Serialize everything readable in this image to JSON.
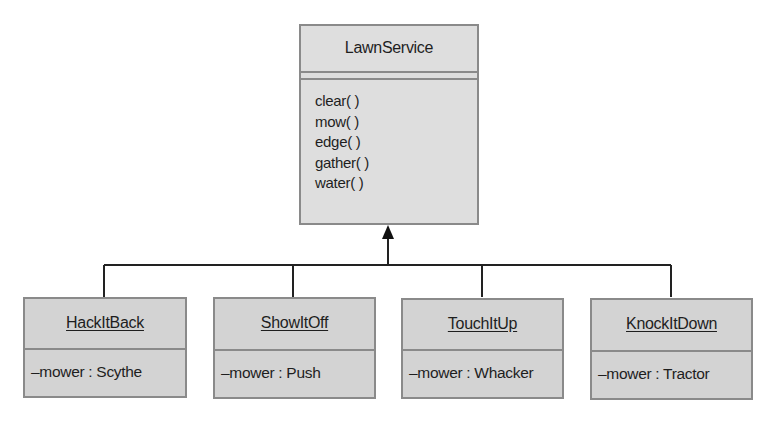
{
  "diagram": {
    "type": "UML class diagram",
    "relationship": "generalization",
    "parent": {
      "name": "LawnService",
      "attributes": [],
      "operations": [
        "clear( )",
        "mow( )",
        "edge( )",
        "gather( )",
        "water( )"
      ]
    },
    "children": [
      {
        "name": "HackItBack",
        "attribute": "–mower : Scythe"
      },
      {
        "name": "ShowItOff",
        "attribute": "–mower : Push"
      },
      {
        "name": "TouchItUp",
        "attribute": "–mower : Whacker"
      },
      {
        "name": "KnockItDown",
        "attribute": "–mower : Tractor"
      }
    ],
    "colors": {
      "parent_fill": "#dedede",
      "child_fill": "#d3d3d3",
      "border": "#8a8a8a",
      "connector": "#222222",
      "text": "#1e1e1e"
    }
  }
}
